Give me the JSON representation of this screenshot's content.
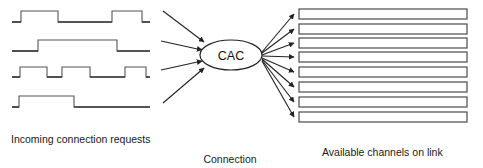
{
  "diagram": {
    "background_color": "#ffffff",
    "line_color": "#555555",
    "dark_line_color": "#3a3a3a",
    "arrow_color": "#222222",
    "text_color": "#1a1a1a",
    "node": {
      "label": "CAC",
      "shape": "ellipse",
      "cx": 231,
      "cy": 55,
      "rx": 31,
      "ry": 15
    },
    "captions": {
      "incoming": "Incoming connection requests",
      "cac_line1": "Connection",
      "cac_line2": "admission",
      "cac_line3": "control",
      "channels": "Available channels on link"
    },
    "waveforms": [
      {
        "name": "request-signal-1",
        "baseline_y": 22,
        "x_start": 12,
        "x_end": 150,
        "pulse_height": 11,
        "pulses": [
          {
            "x1": 21,
            "x2": 58
          },
          {
            "x1": 112,
            "x2": 142
          }
        ]
      },
      {
        "name": "request-signal-2",
        "baseline_y": 51,
        "x_start": 12,
        "x_end": 150,
        "pulse_height": 11,
        "pulses": [
          {
            "x1": 38,
            "x2": 117
          }
        ]
      },
      {
        "name": "request-signal-3",
        "baseline_y": 77,
        "x_start": 12,
        "x_end": 150,
        "pulse_height": 10,
        "pulses": [
          {
            "x1": 20,
            "x2": 47
          },
          {
            "x1": 62,
            "x2": 90
          },
          {
            "x1": 125,
            "x2": 146
          }
        ]
      },
      {
        "name": "request-signal-4",
        "baseline_y": 107,
        "x_start": 12,
        "x_end": 150,
        "pulse_height": 11,
        "pulses": [
          {
            "x1": 19,
            "x2": 74
          }
        ]
      }
    ],
    "input_arrows": [
      {
        "x1": 163,
        "y1": 11,
        "x2": 204,
        "y2": 42
      },
      {
        "x1": 161,
        "y1": 41,
        "x2": 202,
        "y2": 50
      },
      {
        "x1": 161,
        "y1": 70,
        "x2": 202,
        "y2": 61
      },
      {
        "x1": 163,
        "y1": 103,
        "x2": 204,
        "y2": 68
      }
    ],
    "output_arrows": [
      {
        "x1": 262,
        "y1": 52,
        "x2": 294,
        "y2": 14
      },
      {
        "x1": 262,
        "y1": 53,
        "x2": 294,
        "y2": 29
      },
      {
        "x1": 262,
        "y1": 55,
        "x2": 294,
        "y2": 43
      },
      {
        "x1": 262,
        "y1": 56,
        "x2": 294,
        "y2": 57
      },
      {
        "x1": 262,
        "y1": 58,
        "x2": 294,
        "y2": 72
      },
      {
        "x1": 262,
        "y1": 59,
        "x2": 294,
        "y2": 87
      },
      {
        "x1": 262,
        "y1": 60,
        "x2": 294,
        "y2": 102
      },
      {
        "x1": 262,
        "y1": 61,
        "x2": 294,
        "y2": 117
      }
    ],
    "channel_bars": {
      "count": 8,
      "x": 299,
      "width": 168,
      "height": 10,
      "tops": [
        9,
        24,
        38,
        52,
        67,
        82,
        97,
        112
      ]
    }
  }
}
